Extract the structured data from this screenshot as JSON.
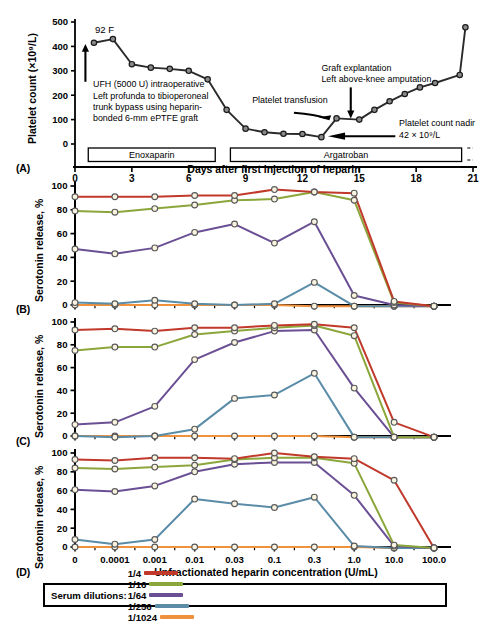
{
  "figure": {
    "panels": [
      "(A)",
      "(B)",
      "(C)",
      "(D)"
    ]
  },
  "panel_a": {
    "letter": "(A)",
    "ylabel": "Platelet count (×10⁹/L)",
    "xlabel": "Days after first injection of heparin",
    "yticks": [
      "0",
      "100",
      "200",
      "300",
      "400",
      "500"
    ],
    "xticks": [
      "0",
      "3",
      "6",
      "9",
      "12",
      "15",
      "18",
      "21"
    ],
    "temperature_note": "92 F",
    "annotation_ufh": [
      "UFH (5000 U) intraoperative",
      "Left profunda to tibioperoneal",
      "trunk bypass using heparin-",
      "bonded 6-mm ePTFE graft"
    ],
    "annotation_transfusion": "Platelet transfusion",
    "annotation_graft": [
      "Graft explantation",
      "Left above-knee amputation"
    ],
    "annotation_nadir": [
      "Platelet count nadir",
      "42 × 10⁹/L"
    ],
    "treatments": [
      {
        "name": "Enoxaparin",
        "start_day": 0.7,
        "end_day": 7.4
      },
      {
        "name": "Argatroban",
        "start_day": 8.2,
        "end_day": 20.4
      }
    ]
  },
  "panel_b": {
    "letter": "(B)",
    "ylabel": "Serotonin release, %"
  },
  "panel_c": {
    "letter": "(C)",
    "ylabel": "Serotonin release, %"
  },
  "panel_d": {
    "letter": "(D)",
    "ylabel": "Serotonin release, %",
    "xlabel": "Unfractionated heparin concentration (U/mL)"
  },
  "legend": {
    "title": "Serum dilutions:",
    "items": [
      {
        "label": "1/4",
        "color": "#c0392b"
      },
      {
        "label": "1/16",
        "color": "#8ba63a"
      },
      {
        "label": "1/64",
        "color": "#6b4f94"
      },
      {
        "label": "1/256",
        "color": "#5a8ca8"
      },
      {
        "label": "1/1024",
        "color": "#f0913e"
      }
    ]
  },
  "chart_data": [
    {
      "type": "line",
      "panel": "A",
      "title": "Platelet count time course",
      "xlabel": "Days after first injection of heparin",
      "ylabel": "Platelet count (×10⁹/L)",
      "xlim": [
        0,
        21
      ],
      "ylim": [
        0,
        500
      ],
      "xticks": [
        0,
        3,
        6,
        9,
        12,
        15,
        18,
        21
      ],
      "yticks": [
        0,
        100,
        200,
        300,
        400,
        500
      ],
      "grid": false,
      "series": [
        {
          "name": "Platelet count",
          "color": "#2b2b2b",
          "x": [
            1.0,
            2.0,
            3.0,
            4.0,
            5.0,
            6.0,
            7.0,
            8.0,
            9.0,
            10.0,
            11.0,
            12.0,
            13.0,
            13.8,
            15.0,
            15.8,
            16.6,
            17.4,
            18.2,
            19.0,
            20.3
          ],
          "y": [
            415,
            430,
            327,
            313,
            308,
            300,
            265,
            140,
            63,
            48,
            42,
            41,
            28,
            105,
            100,
            140,
            175,
            205,
            232,
            250,
            283
          ]
        },
        {
          "name": "Recovery tail",
          "color": "#2b2b2b",
          "x": [
            20.3,
            20.6
          ],
          "y": [
            283,
            478
          ]
        }
      ],
      "annotations": [
        {
          "text": "92 F",
          "x": 1.1,
          "y": 500
        },
        {
          "text": "UFH (5000 U) intraoperative / Left profunda to tibioperoneal / trunk bypass using heparin-bonded 6-mm ePTFE graft",
          "x": 1.0,
          "y": 230
        },
        {
          "text": "Platelet transfusion",
          "x": 11.0,
          "y": 150
        },
        {
          "text": "Graft explantation / Left above-knee amputation",
          "x": 15.0,
          "y": 255
        },
        {
          "text": "Platelet count nadir 42 × 10⁹/L",
          "x": 17.0,
          "y": 55
        }
      ]
    },
    {
      "type": "line",
      "panel": "B",
      "title": "Serotonin release assay - panel B",
      "xlabel": "Unfractionated heparin concentration (U/mL)",
      "ylabel": "Serotonin release, %",
      "categories": [
        "0",
        "0.0001",
        "0.001",
        "0.01",
        "0.03",
        "0.1",
        "0.3",
        "1.0",
        "10.0",
        "100.0"
      ],
      "ylim": [
        0,
        100
      ],
      "yticks": [
        0,
        20,
        40,
        60,
        80,
        100
      ],
      "grid": false,
      "series": [
        {
          "name": "1/4",
          "color": "#c0392b",
          "values": [
            91,
            91,
            91,
            92,
            92,
            97,
            95,
            94,
            3,
            -1
          ]
        },
        {
          "name": "1/16",
          "color": "#8ba63a",
          "values": [
            79,
            78,
            81,
            84,
            88,
            89,
            95,
            88,
            2,
            -1
          ]
        },
        {
          "name": "1/64",
          "color": "#6b4f94",
          "values": [
            47,
            43,
            48,
            61,
            68,
            52,
            70,
            8,
            0,
            -1
          ]
        },
        {
          "name": "1/256",
          "color": "#5a8ca8",
          "values": [
            2,
            1,
            4,
            1,
            0,
            1,
            19,
            -1,
            -1,
            -1
          ]
        },
        {
          "name": "1/1024",
          "color": "#f0913e",
          "values": [
            0,
            0,
            0,
            0,
            0,
            0,
            -1,
            -1,
            -1,
            -1
          ]
        }
      ]
    },
    {
      "type": "line",
      "panel": "C",
      "title": "Serotonin release assay - panel C",
      "xlabel": "Unfractionated heparin concentration (U/mL)",
      "ylabel": "Serotonin release, %",
      "categories": [
        "0",
        "0.0001",
        "0.001",
        "0.01",
        "0.03",
        "0.1",
        "0.3",
        "1.0",
        "10.0",
        "100.0"
      ],
      "ylim": [
        0,
        100
      ],
      "yticks": [
        0,
        20,
        40,
        60,
        80,
        100
      ],
      "grid": false,
      "series": [
        {
          "name": "1/4",
          "color": "#c0392b",
          "values": [
            93,
            94,
            92,
            95,
            95,
            97,
            98,
            95,
            12,
            -1
          ]
        },
        {
          "name": "1/16",
          "color": "#8ba63a",
          "values": [
            75,
            78,
            78,
            89,
            92,
            95,
            97,
            88,
            -1,
            -1
          ]
        },
        {
          "name": "1/64",
          "color": "#6b4f94",
          "values": [
            10,
            12,
            26,
            67,
            82,
            92,
            93,
            42,
            -1,
            -1
          ]
        },
        {
          "name": "1/256",
          "color": "#5a8ca8",
          "values": [
            0,
            -1,
            0,
            6,
            33,
            36,
            55,
            -1,
            -1,
            -1
          ]
        },
        {
          "name": "1/1024",
          "color": "#f0913e",
          "values": [
            0,
            0,
            0,
            0,
            0,
            0,
            0,
            -1,
            -1,
            -1
          ]
        }
      ]
    },
    {
      "type": "line",
      "panel": "D",
      "title": "Serotonin release assay - panel D",
      "xlabel": "Unfractionated heparin concentration (U/mL)",
      "ylabel": "Serotonin release, %",
      "categories": [
        "0",
        "0.0001",
        "0.001",
        "0.01",
        "0.03",
        "0.1",
        "0.3",
        "1.0",
        "10.0",
        "100.0"
      ],
      "ylim": [
        0,
        100
      ],
      "yticks": [
        0,
        20,
        40,
        60,
        80,
        100
      ],
      "grid": false,
      "series": [
        {
          "name": "1/4",
          "color": "#c0392b",
          "values": [
            93,
            92,
            95,
            95,
            94,
            100,
            96,
            94,
            71,
            -1
          ]
        },
        {
          "name": "1/16",
          "color": "#8ba63a",
          "values": [
            84,
            83,
            85,
            87,
            93,
            95,
            95,
            89,
            2,
            -1
          ]
        },
        {
          "name": "1/64",
          "color": "#6b4f94",
          "values": [
            61,
            59,
            65,
            80,
            88,
            90,
            90,
            55,
            1,
            -1
          ]
        },
        {
          "name": "1/256",
          "color": "#5a8ca8",
          "values": [
            8,
            3,
            8,
            51,
            46,
            42,
            53,
            1,
            -1,
            -1
          ]
        },
        {
          "name": "1/1024",
          "color": "#f0913e",
          "values": [
            0,
            0,
            0,
            0,
            0,
            0,
            0,
            0,
            -1,
            -1
          ]
        }
      ]
    }
  ]
}
